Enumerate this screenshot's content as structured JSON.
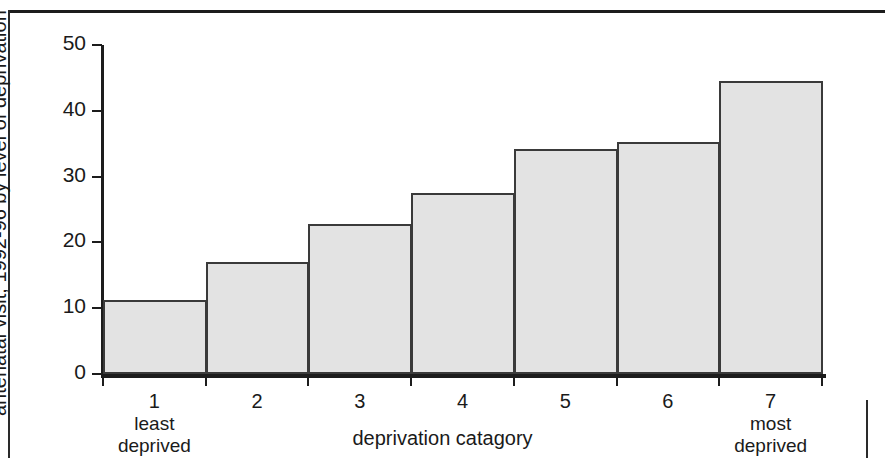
{
  "chart_data": {
    "type": "bar",
    "title": "",
    "subtitle": "",
    "xlabel": "deprivation catagory",
    "ylabel": "Percentage of women smoking at time of first antenatal visit, 1992-96 by level of deprivation",
    "ylabel_lines": [
      "Percentage of women smoking at time of first",
      "antenatal visit, 1992-96 by level of deprivation"
    ],
    "categories": [
      "1",
      "2",
      "3",
      "4",
      "5",
      "6",
      "7"
    ],
    "category_sublabels": [
      [
        "least",
        "deprived"
      ],
      [],
      [],
      [],
      [],
      [],
      [
        "most",
        "deprived"
      ]
    ],
    "values": [
      11.2,
      17.0,
      22.8,
      27.5,
      34.2,
      35.3,
      44.6
    ],
    "ylim": [
      0,
      50
    ],
    "yticks": [
      0,
      10,
      20,
      30,
      40,
      50
    ],
    "ytick_labels": [
      "0",
      "10",
      "20",
      "30",
      "40",
      "50"
    ],
    "grid": false,
    "legend": false,
    "bar_gap": 0,
    "bar_fill_color": "#e3e3e3",
    "bar_edge_color": "#3a3a3a",
    "axis_color": "#1c1c1c",
    "background_color": "#ffffff"
  }
}
